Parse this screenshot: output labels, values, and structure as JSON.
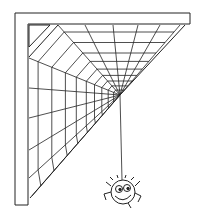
{
  "illustration": {
    "subject": "spider web in corner with hanging spider",
    "style": "black line art on white",
    "colors": {
      "line": "#222222",
      "background": "#ffffff"
    },
    "web": {
      "hub": [
        120,
        95
      ],
      "spokes": 12,
      "rings": 9
    },
    "spider": {
      "position": [
        123,
        193
      ],
      "expression": "smiling"
    }
  }
}
